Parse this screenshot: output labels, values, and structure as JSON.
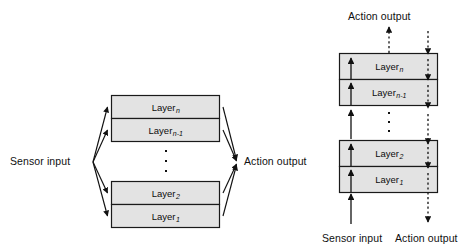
{
  "figure": {
    "background_color": "#ffffff",
    "box_fill": "#e3e3e3",
    "box_stroke": "#1a1a1a",
    "arrow_color": "#111111"
  },
  "left_diagram": {
    "name": "parallel-layered-architecture",
    "input_label": "Sensor input",
    "output_label": "Action output",
    "ellipsis": "⋮",
    "layers": [
      {
        "base": "Layer",
        "sub": "n"
      },
      {
        "base": "Layer",
        "sub": "n-1"
      },
      {
        "base": "Layer",
        "sub": "2"
      },
      {
        "base": "Layer",
        "sub": "1"
      }
    ]
  },
  "right_diagram": {
    "name": "vertical-layered-architecture",
    "top_label": "Action output",
    "bottom_input_label": "Sensor input",
    "bottom_output_label": "Action output",
    "ellipsis": "⋮",
    "layers": [
      {
        "base": "Layer",
        "sub": "n"
      },
      {
        "base": "Layer",
        "sub": "n-1"
      },
      {
        "base": "Layer",
        "sub": "2"
      },
      {
        "base": "Layer",
        "sub": "1"
      }
    ]
  }
}
